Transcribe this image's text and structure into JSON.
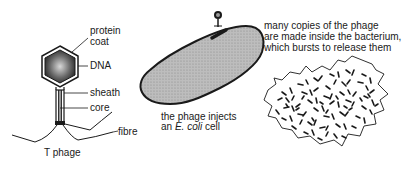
{
  "phage": {
    "labels": {
      "protein_coat_1": "protein",
      "protein_coat_2": "coat",
      "dna": "DNA",
      "sheath": "sheath",
      "core": "core",
      "fibre": "fibre"
    },
    "caption": "T phage"
  },
  "infection": {
    "caption_line1": "the phage injects",
    "caption_line2_prefix": "an ",
    "caption_line2_italic": "E. coli",
    "caption_line2_suffix": " cell"
  },
  "lysis": {
    "caption_line1": "many copies of the phage",
    "caption_line2": "are made inside the bacterium,",
    "caption_line3": "which bursts to release them"
  },
  "colors": {
    "ink": "#1a1a1a",
    "cell_fill": "#b8b8b8",
    "head_fill": "#4a4a4a"
  }
}
